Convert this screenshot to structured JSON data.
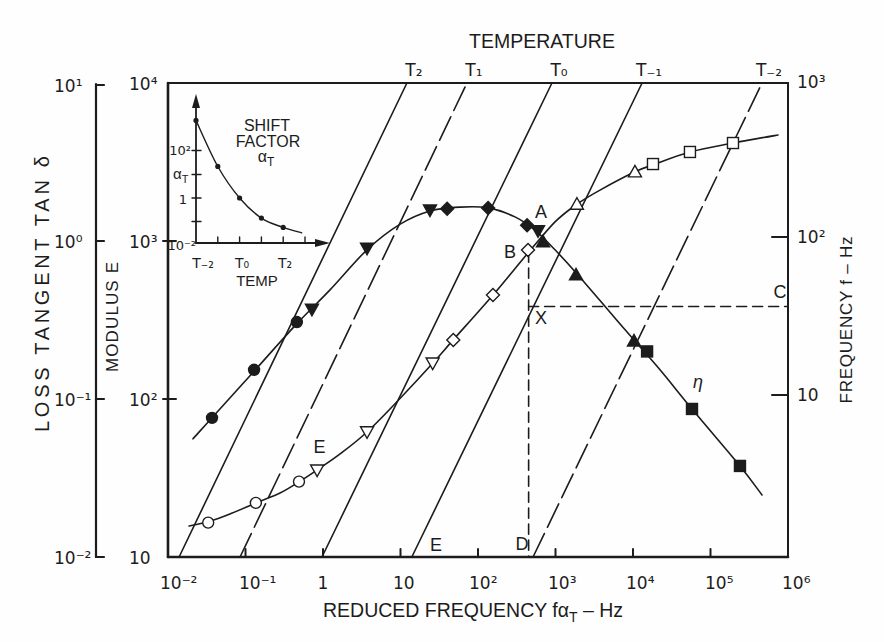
{
  "chart_data": {
    "type": "line",
    "title": "TEMPERATURE",
    "x_axis": {
      "label": "REDUCED FREQUENCY fαT – Hz",
      "label_main": "REDUCED FREQUENCY fα",
      "label_sub": "T",
      "label_tail": " – Hz",
      "scale": "log",
      "range": [
        0.01,
        1000000
      ],
      "ticks": [
        0.01,
        0.1,
        1,
        10,
        100,
        1000,
        10000,
        100000,
        1000000
      ],
      "tick_labels": [
        "10⁻²",
        "10⁻¹",
        "1",
        "10",
        "10²",
        "10³",
        "10⁴",
        "10⁵",
        "10⁶"
      ]
    },
    "y_axis_left_outer": {
      "label": "LOSS TANGENT TAN δ",
      "scale": "log",
      "range": [
        0.01,
        10
      ],
      "ticks": [
        0.01,
        0.1,
        1,
        10
      ],
      "tick_labels": [
        "10⁻²",
        "10⁻¹",
        "10⁰",
        "10¹"
      ]
    },
    "y_axis_left_inner": {
      "label": "MODULUS E",
      "scale": "log",
      "range": [
        10,
        10000
      ],
      "ticks": [
        10,
        100,
        1000,
        10000
      ],
      "tick_labels": [
        "10",
        "10²",
        "10³",
        "10⁴"
      ]
    },
    "y_axis_right": {
      "label": "FREQUENCY f – Hz",
      "scale": "log",
      "range": [
        1,
        1000
      ],
      "ticks": [
        10,
        100,
        1000
      ],
      "tick_labels": [
        "10",
        "10²",
        "10³"
      ]
    },
    "grid": false,
    "legend": null,
    "isotherms": [
      {
        "label": "T₂",
        "temperature_index": 2,
        "style": "solid",
        "reduced_freq_at_f_1hz": 0.0139,
        "reduced_freq_at_f_1000hz": 12.1
      },
      {
        "label": "T₁",
        "temperature_index": 1,
        "style": "dash-dot",
        "reduced_freq_at_f_1hz": 0.085,
        "reduced_freq_at_f_1000hz": 72
      },
      {
        "label": "T₀",
        "temperature_index": 0,
        "style": "solid",
        "reduced_freq_at_f_1hz": 0.97,
        "reduced_freq_at_f_1000hz": 900
      },
      {
        "label": "T₋₁",
        "temperature_index": -1,
        "style": "solid",
        "reduced_freq_at_f_1hz": 14,
        "reduced_freq_at_f_1000hz": 13100
      },
      {
        "label": "T₋₂",
        "temperature_index": -2,
        "style": "dash-dot",
        "reduced_freq_at_f_1hz": 513,
        "reduced_freq_at_f_1000hz": 462000
      }
    ],
    "series": [
      {
        "name": "E",
        "label": "E",
        "y_axis": "modulus",
        "points": [
          {
            "x": 0.033,
            "y": 16.5,
            "marker": "circle",
            "filled": false
          },
          {
            "x": 0.136,
            "y": 22,
            "marker": "circle",
            "filled": false
          },
          {
            "x": 0.49,
            "y": 30,
            "marker": "circle",
            "filled": false
          },
          {
            "x": 0.84,
            "y": 35.5,
            "marker": "triangle-down",
            "filled": false
          },
          {
            "x": 3.7,
            "y": 62,
            "marker": "triangle-down",
            "filled": false
          },
          {
            "x": 26,
            "y": 169,
            "marker": "triangle-down",
            "filled": false
          },
          {
            "x": 48,
            "y": 236,
            "marker": "diamond",
            "filled": false
          },
          {
            "x": 156,
            "y": 455,
            "marker": "diamond",
            "filled": false
          },
          {
            "x": 442,
            "y": 877,
            "marker": "diamond",
            "filled": false
          },
          {
            "x": 1890,
            "y": 1710,
            "marker": "triangle-up",
            "filled": false
          },
          {
            "x": 10600,
            "y": 2740,
            "marker": "triangle-up",
            "filled": false
          },
          {
            "x": 18100,
            "y": 3070,
            "marker": "square",
            "filled": false
          },
          {
            "x": 54300,
            "y": 3660,
            "marker": "square",
            "filled": false
          },
          {
            "x": 195000,
            "y": 4170,
            "marker": "square",
            "filled": false
          }
        ],
        "fit_curve": [
          [
            0.0187,
            15.7
          ],
          [
            0.033,
            16.7
          ],
          [
            0.063,
            18.7
          ],
          [
            0.136,
            22
          ],
          [
            0.279,
            25.4
          ],
          [
            0.49,
            29.9
          ],
          [
            0.84,
            35.6
          ],
          [
            1.66,
            44.9
          ],
          [
            3.7,
            61.8
          ],
          [
            9.9,
            101
          ],
          [
            26.2,
            169
          ],
          [
            47.6,
            236
          ],
          [
            156,
            455
          ],
          [
            442,
            840
          ],
          [
            986,
            1320
          ],
          [
            1890,
            1710
          ],
          [
            3750,
            2100
          ],
          [
            10600,
            2740
          ],
          [
            18100,
            3030
          ],
          [
            54300,
            3660
          ],
          [
            195000,
            4170
          ],
          [
            743000,
            4690
          ]
        ]
      },
      {
        "name": "η",
        "label": "η",
        "y_axis": "loss_tangent",
        "points": [
          {
            "x": 0.037,
            "y": 0.076,
            "marker": "circle",
            "filled": true
          },
          {
            "x": 0.129,
            "y": 0.153,
            "marker": "circle",
            "filled": true
          },
          {
            "x": 0.46,
            "y": 0.307,
            "marker": "circle",
            "filled": true
          },
          {
            "x": 0.72,
            "y": 0.37,
            "marker": "triangle-down",
            "filled": true
          },
          {
            "x": 3.7,
            "y": 0.9,
            "marker": "triangle-down",
            "filled": true
          },
          {
            "x": 24,
            "y": 1.57,
            "marker": "triangle-down",
            "filled": true
          },
          {
            "x": 40,
            "y": 1.6,
            "marker": "diamond",
            "filled": true
          },
          {
            "x": 135,
            "y": 1.62,
            "marker": "diamond",
            "filled": true
          },
          {
            "x": 430,
            "y": 1.26,
            "marker": "diamond",
            "filled": true
          },
          {
            "x": 595,
            "y": 1.16,
            "marker": "triangle-down",
            "filled": true
          },
          {
            "x": 690,
            "y": 0.99,
            "marker": "triangle-up",
            "filled": true
          },
          {
            "x": 1840,
            "y": 0.61,
            "marker": "triangle-up",
            "filled": true
          },
          {
            "x": 10300,
            "y": 0.233,
            "marker": "triangle-up",
            "filled": true
          },
          {
            "x": 15200,
            "y": 0.2,
            "marker": "square",
            "filled": true
          },
          {
            "x": 57700,
            "y": 0.0865,
            "marker": "square",
            "filled": true
          },
          {
            "x": 240000,
            "y": 0.0377,
            "marker": "square",
            "filled": true
          }
        ],
        "fit_curve": [
          [
            0.021,
            0.056
          ],
          [
            0.037,
            0.076
          ],
          [
            0.129,
            0.15
          ],
          [
            0.46,
            0.3
          ],
          [
            1.23,
            0.49
          ],
          [
            3.7,
            0.88
          ],
          [
            9.9,
            1.28
          ],
          [
            24,
            1.55
          ],
          [
            59,
            1.64
          ],
          [
            135,
            1.62
          ],
          [
            300,
            1.42
          ],
          [
            543,
            1.17
          ],
          [
            985,
            0.88
          ],
          [
            1840,
            0.63
          ],
          [
            3750,
            0.42
          ],
          [
            10300,
            0.236
          ],
          [
            22300,
            0.153
          ],
          [
            57700,
            0.0865
          ],
          [
            240000,
            0.0377
          ],
          [
            462000,
            0.0247
          ]
        ]
      }
    ],
    "guides": [
      {
        "name": "vertical-drop-b-to-d",
        "orientation": "vertical",
        "style": "dashed",
        "reduced_freq": 450,
        "from_modulus": 850,
        "to_modulus": 10
      },
      {
        "name": "horizontal-c-to-x",
        "orientation": "horizontal",
        "style": "dashed",
        "frequency_hz": 38.5,
        "from_reduced_freq": 450,
        "to_reduced_freq": 1000000
      }
    ],
    "annotations": [
      {
        "label": "A",
        "reduced_freq": 650,
        "modulus": 1530
      },
      {
        "label": "B",
        "reduced_freq": 259,
        "modulus": 851
      },
      {
        "label": "C",
        "reduced_freq": 789000,
        "modulus": 475
      },
      {
        "label": "D",
        "reduced_freq": 370,
        "modulus": 12.1
      },
      {
        "label": "E",
        "reduced_freq": 28.7,
        "modulus": 11.9
      },
      {
        "label": "E",
        "reduced_freq": 0.9,
        "modulus": 49.7
      },
      {
        "label": "X",
        "reduced_freq": 650,
        "modulus": 328
      },
      {
        "label": "η",
        "reduced_freq": 69000,
        "modulus": 128
      }
    ],
    "inset": {
      "type": "line",
      "title_line1": "SHIFT",
      "title_line2": "FACTOR",
      "title_line3_main": "α",
      "title_line3_sub": "T",
      "x_label": "TEMP",
      "x_tick_labels": [
        "T₋₂",
        "T₀",
        "T₂"
      ],
      "y_tick_label_top": "10²",
      "y_axis_name_main": "α",
      "y_axis_name_sub": "T",
      "y_tick_label_one": "1",
      "y_tick_label_bottom": "10⁻²",
      "y_scale": "log",
      "points": [
        {
          "temperature": "T₋₂",
          "t": -2,
          "shift_factor": 2000
        },
        {
          "temperature": "T₋₁",
          "t": -1,
          "shift_factor": 22
        },
        {
          "temperature": "T₀",
          "t": 0,
          "shift_factor": 1
        },
        {
          "temperature": "T₁",
          "t": 1,
          "shift_factor": 0.14
        },
        {
          "temperature": "T₂",
          "t": 2,
          "shift_factor": 0.056
        }
      ],
      "fit_curve_end": {
        "t": 2.85,
        "shift_factor": 0.033
      }
    }
  }
}
